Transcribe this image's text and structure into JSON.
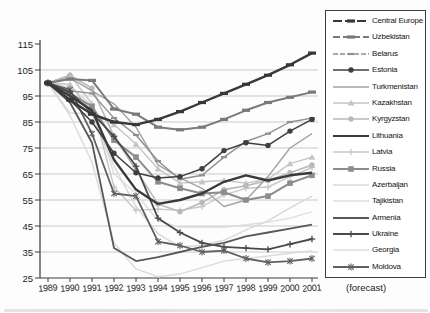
{
  "note": "(forecast)",
  "chart_data": {
    "type": "line",
    "x": [
      1989,
      1990,
      1991,
      1992,
      1993,
      1994,
      1995,
      1996,
      1997,
      1998,
      1999,
      2000,
      2001
    ],
    "x_note": "(forecast)",
    "ylim": [
      25,
      115
    ],
    "yticks": [
      25,
      35,
      45,
      55,
      65,
      75,
      85,
      95,
      105,
      115
    ],
    "gridline_values": [
      35,
      45,
      55,
      65,
      75,
      85,
      95,
      105
    ],
    "grid_on": true,
    "legend_position": "right",
    "axis_color": "#3c3c3c",
    "grid_color": "#b2b2b2",
    "series": [
      {
        "name": "Central Europe",
        "color": "#383838",
        "width": 2.4,
        "marker": "dash",
        "sample_dash": "9 3",
        "values": [
          100,
          93.5,
          88,
          85,
          84,
          86,
          89,
          92.5,
          96,
          99.5,
          103,
          107,
          111.5
        ]
      },
      {
        "name": "Uzbekistan",
        "color": "#7a7a7a",
        "width": 2,
        "marker": "dash",
        "sample_dash": "7 3",
        "values": [
          100,
          101.5,
          101,
          90,
          88,
          83,
          82,
          83,
          86,
          89.5,
          92.5,
          94.5,
          96.5
        ]
      },
      {
        "name": "Belarus",
        "color": "#8f8f8f",
        "width": 1.4,
        "marker": "dash-small",
        "sample_dash": "5 2",
        "values": [
          100,
          97,
          96,
          86.5,
          80,
          70,
          63,
          64.5,
          71.5,
          77.5,
          80.5,
          85,
          86.5
        ]
      },
      {
        "name": "Estonia",
        "color": "#3f3f3f",
        "width": 1.5,
        "marker": "circle",
        "values": [
          100,
          93.5,
          85,
          73,
          65.5,
          63.5,
          64,
          67,
          74,
          77,
          76,
          81.5,
          86
        ]
      },
      {
        "name": "Turkmenistan",
        "color": "#a3a3a3",
        "width": 1.4,
        "marker": "none",
        "values": [
          100,
          102,
          97,
          92,
          83,
          68.5,
          63.5,
          59.5,
          52.5,
          55,
          64,
          75,
          80.5
        ]
      },
      {
        "name": "Kazakhstan",
        "color": "#c4c4c4",
        "width": 1.4,
        "marker": "triangle",
        "values": [
          100,
          99.5,
          88.5,
          84,
          76.5,
          67,
          61.5,
          62,
          62.5,
          61.5,
          63,
          69,
          71.5
        ]
      },
      {
        "name": "Kyrgyzstan",
        "color": "#b9b9b9",
        "width": 1.6,
        "marker": "circle",
        "values": [
          100,
          103,
          98,
          79.5,
          66.5,
          53.5,
          50.5,
          54,
          59,
          60.5,
          62.5,
          65.5,
          68.5
        ]
      },
      {
        "name": "Lithuania",
        "color": "#3a3a3a",
        "width": 2.4,
        "marker": "none",
        "values": [
          100,
          95,
          89.5,
          70.5,
          59,
          53.5,
          55,
          57.5,
          62,
          64.5,
          62.5,
          64.5,
          65.5
        ]
      },
      {
        "name": "Latvia",
        "color": "#c7c7c7",
        "width": 1.4,
        "marker": "plus",
        "values": [
          100,
          103,
          92,
          60,
          51,
          51.5,
          51,
          52.5,
          57,
          59.5,
          60,
          64,
          67.5
        ]
      },
      {
        "name": "Russia",
        "color": "#8c8c8c",
        "width": 2,
        "marker": "square",
        "values": [
          100,
          96,
          91,
          78,
          71.5,
          62,
          59.5,
          57.5,
          58,
          55,
          56.5,
          61.5,
          64.5
        ]
      },
      {
        "name": "Azerbaijan",
        "color": "#d8d8d8",
        "width": 1.4,
        "marker": "none",
        "values": [
          100,
          88.5,
          88,
          68,
          52.5,
          42,
          37,
          37.5,
          39.5,
          43.5,
          47,
          52,
          56.5
        ]
      },
      {
        "name": "Tajikistan",
        "color": "#dedede",
        "width": 1.4,
        "marker": "none",
        "values": [
          100,
          98.5,
          91.5,
          65,
          57.5,
          47,
          44.5,
          44.5,
          44.5,
          45.5,
          46.5,
          48,
          50.5
        ]
      },
      {
        "name": "Armenia",
        "color": "#585858",
        "width": 1.8,
        "marker": "none",
        "values": [
          100,
          92.5,
          77,
          36.5,
          31.5,
          33,
          35,
          37,
          38.5,
          41,
          42.5,
          44,
          45.5
        ]
      },
      {
        "name": "Ukraine",
        "color": "#4a4a4a",
        "width": 1.8,
        "marker": "plus",
        "values": [
          100,
          96.5,
          88.5,
          79.5,
          68,
          48,
          42.5,
          38.5,
          37,
          36.5,
          36,
          38,
          40
        ]
      },
      {
        "name": "Georgia",
        "color": "#dcdcdc",
        "width": 1.5,
        "marker": "none",
        "values": [
          100,
          87.5,
          69.5,
          38.5,
          28.5,
          25.5,
          26.5,
          29,
          31.5,
          32.5,
          33.5,
          34.5,
          35.5
        ]
      },
      {
        "name": "Moldova",
        "color": "#606060",
        "width": 1.8,
        "marker": "star",
        "values": [
          100,
          97.5,
          80.5,
          57.5,
          56.5,
          39,
          37.5,
          35,
          35.5,
          32.5,
          31,
          31.5,
          32.5
        ]
      }
    ],
    "draw_order": [
      14,
      11,
      10,
      8,
      5,
      6,
      4,
      2,
      9,
      1,
      15,
      13,
      12,
      3,
      7,
      0
    ]
  }
}
